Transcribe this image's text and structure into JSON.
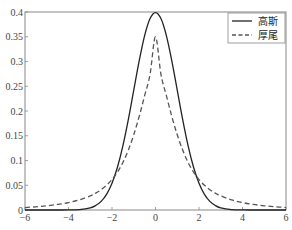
{
  "chart_data": {
    "type": "line",
    "title": "",
    "xlabel": "",
    "ylabel": "",
    "xlim": [
      -6,
      6
    ],
    "ylim": [
      0,
      0.4
    ],
    "x_ticks": [
      "-6",
      "-4",
      "-2",
      "0",
      "2",
      "4",
      "6"
    ],
    "y_ticks": [
      "0",
      "0.05",
      "0.1",
      "0.15",
      "0.2",
      "0.25",
      "0.3",
      "0.35",
      "0.4"
    ],
    "grid": false,
    "legend_position": "upper right",
    "x": [
      -6,
      -5.5,
      -5,
      -4.5,
      -4,
      -3.5,
      -3,
      -2.75,
      -2.5,
      -2.25,
      -2,
      -1.75,
      -1.5,
      -1.25,
      -1,
      -0.75,
      -0.5,
      -0.25,
      0,
      0.25,
      0.5,
      0.75,
      1,
      1.25,
      1.5,
      1.75,
      2,
      2.25,
      2.5,
      2.75,
      3,
      3.5,
      4,
      4.5,
      5,
      5.5,
      6
    ],
    "series": [
      {
        "name": "高斯",
        "style": "solid",
        "values": [
          0.0,
          0.0,
          0.0,
          0.0,
          0.0001,
          0.0009,
          0.0044,
          0.0091,
          0.0175,
          0.0317,
          0.054,
          0.0863,
          0.1295,
          0.1826,
          0.242,
          0.3011,
          0.3521,
          0.3867,
          0.3989,
          0.3867,
          0.3521,
          0.3011,
          0.242,
          0.1826,
          0.1295,
          0.0863,
          0.054,
          0.0317,
          0.0175,
          0.0091,
          0.0044,
          0.0009,
          0.0001,
          0.0,
          0.0,
          0.0,
          0.0
        ]
      },
      {
        "name": "厚尾",
        "style": "dashed",
        "values": [
          0.005,
          0.0065,
          0.0085,
          0.0112,
          0.015,
          0.0205,
          0.0285,
          0.034,
          0.041,
          0.05,
          0.0615,
          0.0765,
          0.096,
          0.121,
          0.152,
          0.189,
          0.231,
          0.274,
          0.35,
          0.274,
          0.231,
          0.189,
          0.152,
          0.121,
          0.096,
          0.0765,
          0.0615,
          0.05,
          0.041,
          0.034,
          0.0285,
          0.0205,
          0.015,
          0.0112,
          0.0085,
          0.0065,
          0.005
        ]
      }
    ]
  },
  "legend": {
    "items": [
      "高斯",
      "厚尾"
    ]
  }
}
